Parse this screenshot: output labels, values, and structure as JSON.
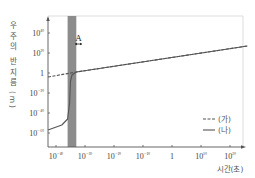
{
  "chart_data": {
    "type": "line",
    "title": "",
    "xlabel": "시간(초)",
    "ylabel": "우주의 반지름(m)",
    "x_scale": "log",
    "y_scale": "log",
    "x_tick_exponents": [
      -40,
      -30,
      -20,
      -10,
      0,
      10,
      20
    ],
    "x_tick_labels": [
      "10⁻⁴⁰",
      "10⁻³⁰",
      "10⁻²⁰",
      "10⁻¹⁰",
      "1",
      "10¹⁰",
      "10²⁰"
    ],
    "y_tick_exponents": [
      40,
      20,
      0,
      -20,
      -40,
      -60
    ],
    "y_tick_labels": [
      "10⁴⁰",
      "10²⁰",
      "1",
      "10⁻²⁰",
      "10⁻⁴⁰",
      "10⁻⁶⁰"
    ],
    "xlim_exponent": [
      -44,
      26
    ],
    "ylim_exponent": [
      -73,
      58
    ],
    "grid": false,
    "legend_position": "lower right",
    "shaded_region": {
      "label": "A",
      "x_exponent_range": [
        -36,
        -33
      ]
    },
    "series": [
      {
        "name": "(가)",
        "style": "dashed",
        "color": "#555555",
        "points": [
          {
            "x_exp": -44,
            "y_exp": -4
          },
          {
            "x_exp": -33,
            "y_exp": 1
          },
          {
            "x_exp": 26,
            "y_exp": 27
          }
        ]
      },
      {
        "name": "(나)",
        "style": "solid",
        "color": "#555555",
        "points": [
          {
            "x_exp": -44,
            "y_exp": -57
          },
          {
            "x_exp": -38,
            "y_exp": -52
          },
          {
            "x_exp": -36,
            "y_exp": -46
          },
          {
            "x_exp": -35.3,
            "y_exp": -30
          },
          {
            "x_exp": -35,
            "y_exp": -8
          },
          {
            "x_exp": -34.5,
            "y_exp": -2
          },
          {
            "x_exp": -33,
            "y_exp": 1
          },
          {
            "x_exp": 26,
            "y_exp": 27
          }
        ]
      }
    ]
  },
  "labels": {
    "y_axis_title_chars": [
      "우",
      "주",
      "의",
      "반",
      "지",
      "름",
      "(",
      "m",
      ")"
    ],
    "x_axis_title": "시간(초)",
    "region_label": "A",
    "legend": [
      {
        "symbol": "---",
        "label": "(가)"
      },
      {
        "symbol": "—",
        "label": "(나)"
      }
    ]
  },
  "colors": {
    "axis": "#555555",
    "frame": "#dddddd",
    "shade": "#8c8c8c",
    "curve": "#555555"
  }
}
